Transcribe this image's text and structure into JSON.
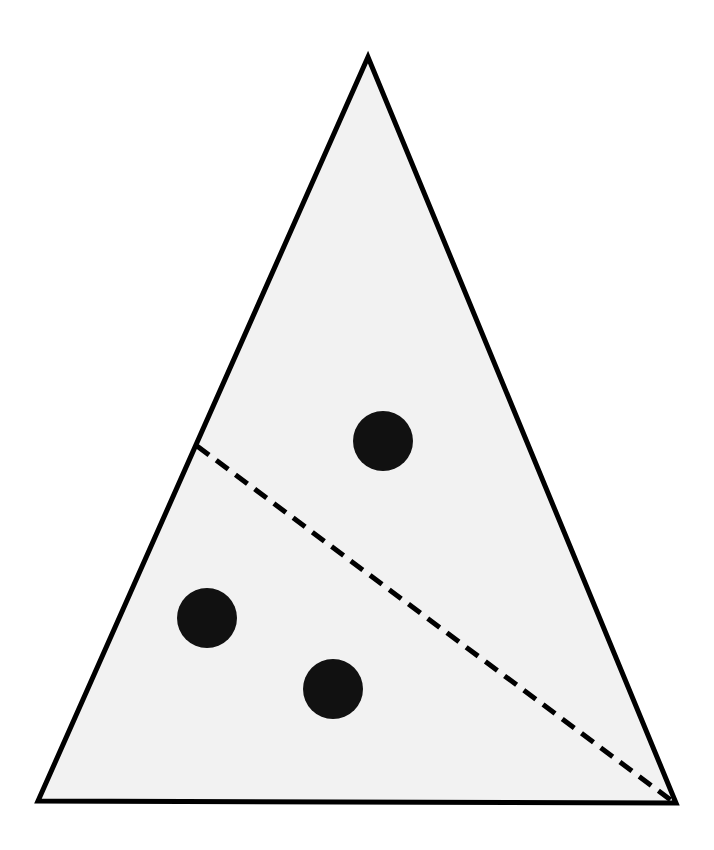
{
  "diagram": {
    "type": "triangle-with-points",
    "width": 714,
    "height": 850,
    "background": "#ffffff",
    "triangle": {
      "vertices": [
        [
          368,
          57
        ],
        [
          38,
          801
        ],
        [
          676,
          803
        ]
      ],
      "fill": "#f2f2f2",
      "stroke": "#000000",
      "stroke_width": 5
    },
    "dashed_line": {
      "from": [
        197,
        446
      ],
      "to": [
        672,
        801
      ],
      "stroke": "#000000",
      "stroke_width": 5,
      "dash": "15 9"
    },
    "points": [
      {
        "cx": 383,
        "cy": 441,
        "r": 30,
        "fill": "#111111"
      },
      {
        "cx": 207,
        "cy": 618,
        "r": 30,
        "fill": "#111111"
      },
      {
        "cx": 333,
        "cy": 689,
        "r": 30,
        "fill": "#111111"
      }
    ]
  }
}
